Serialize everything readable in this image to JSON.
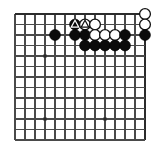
{
  "diagram": {
    "kind": "go-board-diagram",
    "colors": {
      "background": "#ffffff",
      "grid_line": "#4a4a4a",
      "edge_line": "#2b2b2b",
      "black_stone": "#0b0b0b",
      "white_stone": "#ffffff",
      "stone_outline": "#111111",
      "star_point": "#2b2b2b"
    },
    "board": {
      "cols": 14,
      "rows": 13,
      "origin_x": 15,
      "origin_y": 14,
      "step_x": 10.0,
      "step_y": 10.5,
      "stone_radius": 5.4,
      "edges": {
        "top": true,
        "right": true,
        "left": false,
        "bottom": false
      }
    },
    "star_points": [
      {
        "col": 3,
        "row": 4
      },
      {
        "col": 3,
        "row": 10
      },
      {
        "col": 9,
        "row": 10
      }
    ],
    "stones": [
      {
        "col": 13,
        "row": 0,
        "color": "white",
        "mark": "none"
      },
      {
        "col": 6,
        "row": 1,
        "color": "black",
        "mark": "triangle"
      },
      {
        "col": 7,
        "row": 1,
        "color": "white",
        "mark": "triangle"
      },
      {
        "col": 8,
        "row": 1,
        "color": "white",
        "mark": "none"
      },
      {
        "col": 13,
        "row": 1,
        "color": "white",
        "mark": "none"
      },
      {
        "col": 4,
        "row": 2,
        "color": "black",
        "mark": "none"
      },
      {
        "col": 6,
        "row": 2,
        "color": "black",
        "mark": "none"
      },
      {
        "col": 7,
        "row": 2,
        "color": "black",
        "mark": "none"
      },
      {
        "col": 8,
        "row": 2,
        "color": "white",
        "mark": "none"
      },
      {
        "col": 9,
        "row": 2,
        "color": "white",
        "mark": "none"
      },
      {
        "col": 10,
        "row": 2,
        "color": "white",
        "mark": "none"
      },
      {
        "col": 11,
        "row": 2,
        "color": "black",
        "mark": "none"
      },
      {
        "col": 13,
        "row": 2,
        "color": "black",
        "mark": "none"
      },
      {
        "col": 7,
        "row": 3,
        "color": "black",
        "mark": "none"
      },
      {
        "col": 8,
        "row": 3,
        "color": "black",
        "mark": "none"
      },
      {
        "col": 9,
        "row": 3,
        "color": "black",
        "mark": "none"
      },
      {
        "col": 10,
        "row": 3,
        "color": "black",
        "mark": "none"
      },
      {
        "col": 11,
        "row": 3,
        "color": "black",
        "mark": "none"
      }
    ]
  }
}
